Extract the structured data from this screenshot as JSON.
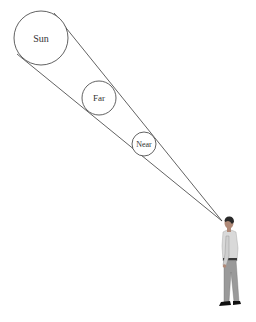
{
  "diagram": {
    "type": "angular-size-cone",
    "colors": {
      "line": "#3a3a3a",
      "background": "#ffffff",
      "text": "#333333",
      "shirt": "#d9d9d9",
      "trousers": "#9a9a9a",
      "hair": "#2a2a2a",
      "shoes": "#111111"
    },
    "circles": [
      {
        "id": "sun",
        "label": "Sun",
        "cx": 41,
        "cy": 38,
        "r": 27,
        "font_size": 10
      },
      {
        "id": "far",
        "label": "Far",
        "cx": 99,
        "cy": 98,
        "r": 17,
        "font_size": 9
      },
      {
        "id": "near",
        "label": "Near",
        "cx": 144,
        "cy": 144,
        "r": 12,
        "font_size": 8
      }
    ],
    "cone": {
      "apex": [
        222,
        221
      ],
      "upper_edge_start": [
        54,
        13
      ],
      "lower_edge_start": [
        17,
        54
      ]
    },
    "observer": {
      "label": "person-observer"
    }
  }
}
